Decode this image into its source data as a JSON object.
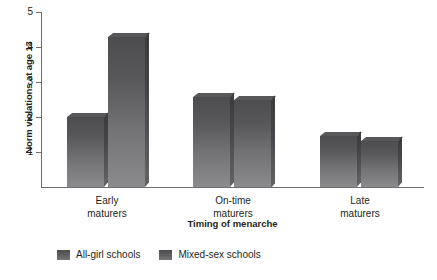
{
  "chart_data": {
    "type": "bar",
    "title": "",
    "xlabel": "Timing of menarche",
    "ylabel": "Norm violations at age 13",
    "categories": [
      "Early maturers",
      "On-time maturers",
      "Late maturers"
    ],
    "category_lines": [
      [
        "Early",
        "maturers"
      ],
      [
        "On-time",
        "maturers"
      ],
      [
        "Late",
        "maturers"
      ]
    ],
    "series": [
      {
        "name": "All-girl schools",
        "values": [
          2.0,
          2.57,
          1.46
        ],
        "color": "#58585a"
      },
      {
        "name": "Mixed-sex schools",
        "values": [
          4.28,
          2.5,
          1.31
        ],
        "color": "#58585a"
      }
    ],
    "ylim": [
      0,
      5
    ],
    "yticks": [
      5,
      4,
      3,
      2,
      1
    ],
    "ytick_labels": [
      "5",
      "4",
      "3",
      "2",
      "1"
    ],
    "grid": false,
    "legend_position": "bottom-left"
  },
  "legend": {
    "items": [
      {
        "label": "All-girl schools"
      },
      {
        "label": "Mixed-sex schools"
      }
    ]
  }
}
